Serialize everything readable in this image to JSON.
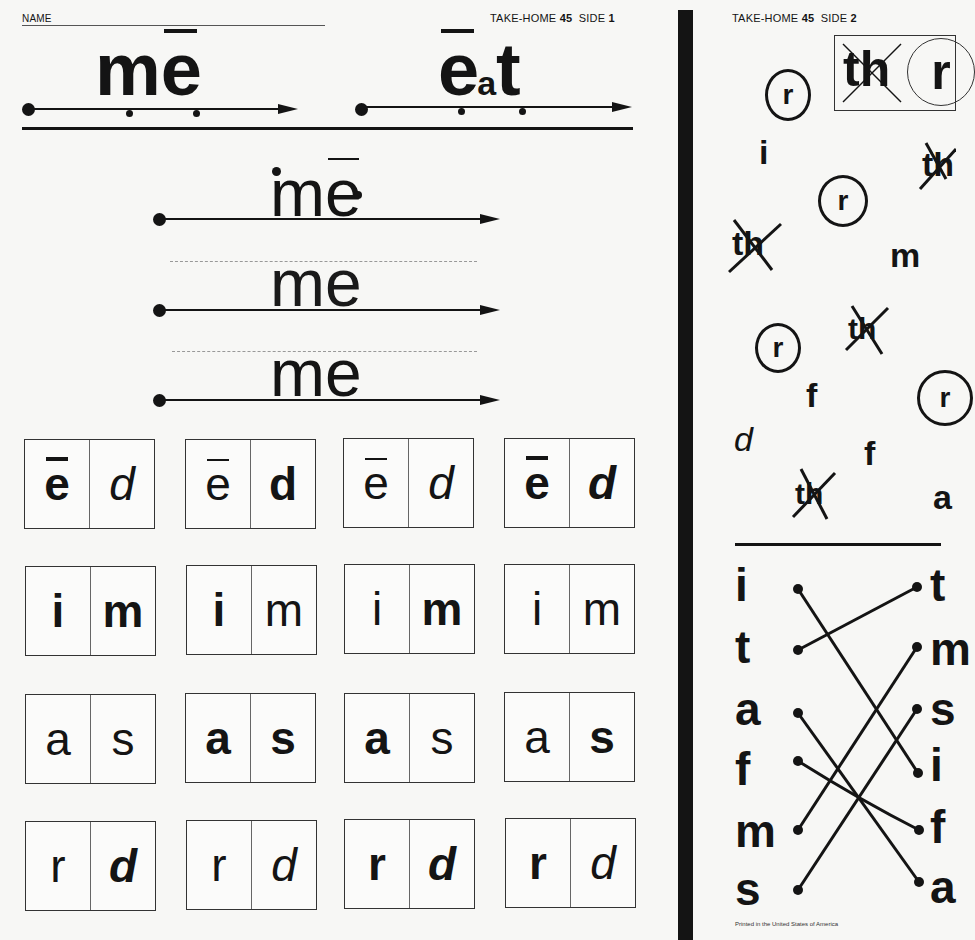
{
  "side1": {
    "name_label": "NAME",
    "header_prefix": "TAKE-HOME",
    "header_number": "45",
    "header_side_label": "SIDE",
    "header_side_number": "1",
    "model_words": [
      {
        "letters": "m",
        "long_vowel": "e",
        "display": "mē"
      },
      {
        "long_vowel": "e",
        "small_letter": "a",
        "end_letter": "t",
        "display": "ēat"
      }
    ],
    "trace_lines": [
      {
        "word_start": "m",
        "word_vowel": "e",
        "macron": true
      },
      {
        "word_start": "m",
        "word_vowel": "e",
        "macron": false
      },
      {
        "word_start": "m",
        "word_vowel": "e",
        "macron": false
      }
    ],
    "cards": [
      [
        {
          "left": "e",
          "left_bold": true,
          "left_macron": true,
          "right": "d",
          "right_bold": false,
          "right_italic": true
        },
        {
          "left": "e",
          "left_bold": false,
          "left_macron": true,
          "right": "d",
          "right_bold": true,
          "right_italic": false
        },
        {
          "left": "e",
          "left_bold": false,
          "left_macron": true,
          "right": "d",
          "right_bold": false,
          "right_italic": true
        },
        {
          "left": "e",
          "left_bold": true,
          "left_macron": true,
          "right": "d",
          "right_bold": false,
          "right_italic": true
        }
      ],
      [
        {
          "left": "i",
          "left_bold": true,
          "right": "m",
          "right_bold": true
        },
        {
          "left": "i",
          "left_bold": true,
          "right": "m",
          "right_bold": false
        },
        {
          "left": "i",
          "left_bold": false,
          "right": "m",
          "right_bold": true
        },
        {
          "left": "i",
          "left_bold": false,
          "right": "m",
          "right_bold": false
        }
      ],
      [
        {
          "left": "a",
          "left_bold": false,
          "right": "s",
          "right_bold": false
        },
        {
          "left": "a",
          "left_bold": true,
          "right": "s",
          "right_bold": true
        },
        {
          "left": "a",
          "left_bold": true,
          "right": "s",
          "right_bold": false
        },
        {
          "left": "a",
          "left_bold": false,
          "right": "s",
          "right_bold": true
        }
      ],
      [
        {
          "left": "r",
          "left_bold": false,
          "right": "d",
          "right_bold": true
        },
        {
          "left": "r",
          "left_bold": false,
          "right": "d",
          "right_bold": false
        },
        {
          "left": "r",
          "left_bold": true,
          "right": "d",
          "right_bold": true
        },
        {
          "left": "r",
          "left_bold": true,
          "right": "d",
          "right_bold": false
        }
      ]
    ]
  },
  "side2": {
    "header_prefix": "TAKE-HOME",
    "header_number": "45",
    "header_side_label": "SIDE",
    "header_side_number": "2",
    "key_box": {
      "crossed": "th",
      "circled": "r"
    },
    "scatter_letters": [
      {
        "char": "r",
        "mark": "circled"
      },
      {
        "char": "i",
        "mark": "none"
      },
      {
        "char": "r",
        "mark": "circled"
      },
      {
        "char": "th",
        "mark": "crossed"
      },
      {
        "char": "th",
        "mark": "crossed"
      },
      {
        "char": "m",
        "mark": "none"
      },
      {
        "char": "r",
        "mark": "circled"
      },
      {
        "char": "th",
        "mark": "crossed"
      },
      {
        "char": "f",
        "mark": "none"
      },
      {
        "char": "r",
        "mark": "circled"
      },
      {
        "char": "d",
        "mark": "none"
      },
      {
        "char": "f",
        "mark": "none"
      },
      {
        "char": "th",
        "mark": "crossed"
      },
      {
        "char": "a",
        "mark": "none"
      }
    ],
    "matching": {
      "left": [
        "i",
        "t",
        "a",
        "f",
        "m",
        "s"
      ],
      "right": [
        "t",
        "m",
        "s",
        "i",
        "f",
        "a"
      ]
    },
    "footer": "Printed in the United States of America"
  }
}
